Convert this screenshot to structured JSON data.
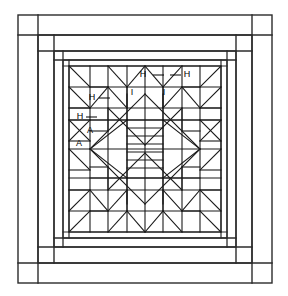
{
  "diagram": {
    "type": "quilt-block-line-drawing",
    "background_color": "#ffffff",
    "line_color": "#1a1a1a",
    "frame_color": "#2b2b2b",
    "canvas": {
      "width": 288,
      "height": 296
    }
  },
  "borders": [
    {
      "name": "outer-border",
      "x": 18,
      "y": 15,
      "width": 254,
      "height": 268,
      "corner_inset": 20
    },
    {
      "name": "second-border",
      "x": 38,
      "y": 35,
      "width": 214,
      "height": 228,
      "corner_inset": 16
    },
    {
      "name": "third-border",
      "x": 54,
      "y": 51,
      "width": 182,
      "height": 196,
      "corner_inset": 9
    },
    {
      "name": "inner-border",
      "x": 63,
      "y": 60,
      "width": 164,
      "height": 178,
      "corner_inset": 6
    }
  ],
  "block": {
    "name": "feathered-star",
    "x": 69,
    "y": 66,
    "width": 152,
    "height": 166,
    "grid_columns": 8,
    "grid_rows": 8,
    "center": {
      "name": "striped-center-square",
      "x": 127,
      "y": 120,
      "width": 36,
      "height": 58,
      "stripe_count": 7
    }
  },
  "labels": [
    {
      "id": "label-h-top-left",
      "text": "H",
      "x": 146,
      "y": 75,
      "leader_dir": "right",
      "leader_len": 11
    },
    {
      "id": "label-h-top-right",
      "text": "H",
      "x": 188,
      "y": 75,
      "leader_dir": "left",
      "leader_len": 11
    },
    {
      "id": "label-i-left",
      "text": "I",
      "x": 132,
      "y": 93,
      "leader_dir": "none",
      "leader_len": 0
    },
    {
      "id": "label-i-right",
      "text": "I",
      "x": 163,
      "y": 93,
      "leader_dir": "none",
      "leader_len": 0
    },
    {
      "id": "label-h-mid-left",
      "text": "H",
      "x": 92,
      "y": 98,
      "leader_dir": "right",
      "leader_len": 11
    },
    {
      "id": "label-h-low-left",
      "text": "H",
      "x": 79,
      "y": 117,
      "leader_dir": "right",
      "leader_len": 11
    },
    {
      "id": "label-a-upper",
      "text": "A",
      "x": 89,
      "y": 131,
      "leader_dir": "none",
      "leader_len": 0
    },
    {
      "id": "label-a-lower",
      "text": "A",
      "x": 79,
      "y": 143,
      "leader_dir": "none",
      "leader_len": 0
    }
  ],
  "legend_keys": [
    "A",
    "H",
    "I"
  ]
}
